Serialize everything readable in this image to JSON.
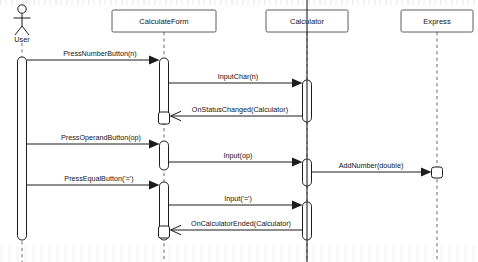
{
  "diagram": {
    "type": "uml-sequence-diagram",
    "width": 478,
    "height": 262,
    "background": "#ffffff",
    "line_color": "#1c1c1c",
    "lifeline_color": "#5a5a5a",
    "box_fill": "#ffffff"
  },
  "participants": [
    {
      "id": "user",
      "label": "User",
      "kind": "actor",
      "x": 22,
      "head_y": 38
    },
    {
      "id": "calculateform",
      "label": "CalculateForm",
      "kind": "object",
      "x": 164,
      "head_y": 21
    },
    {
      "id": "calculator",
      "label": "Calculator",
      "kind": "object",
      "x": 307,
      "head_y": 21
    },
    {
      "id": "express",
      "label": "Express",
      "kind": "object",
      "x": 437,
      "head_y": 21
    }
  ],
  "messages": [
    {
      "n": 1,
      "label": "PressNumberButton(n)",
      "from": "user",
      "to": "calculateform",
      "y": 60,
      "dir": "right",
      "style": "call"
    },
    {
      "n": 2,
      "label": "InputChar(n)",
      "from": "calculateform",
      "to": "calculator",
      "y": 83,
      "dir": "right",
      "style": "call"
    },
    {
      "n": 3,
      "label": "OnStatusChanged(Calculator)",
      "from": "calculator",
      "to": "calculateform",
      "y": 116,
      "dir": "left",
      "style": "return"
    },
    {
      "n": 4,
      "label": "PressOperandButton(op)",
      "from": "user",
      "to": "calculateform",
      "y": 144,
      "dir": "right",
      "style": "call"
    },
    {
      "n": 5,
      "label": "Input(op)",
      "from": "calculateform",
      "to": "calculator",
      "y": 162,
      "dir": "right",
      "style": "call"
    },
    {
      "n": 6,
      "label": "AddNumber(double)",
      "from": "calculator",
      "to": "express",
      "y": 172,
      "dir": "right",
      "style": "call"
    },
    {
      "n": 7,
      "label": "PressEqualButton('=')",
      "from": "user",
      "to": "calculateform",
      "y": 185,
      "dir": "right",
      "style": "call"
    },
    {
      "n": 8,
      "label": "Input('=')",
      "from": "calculateform",
      "to": "calculator",
      "y": 205,
      "dir": "right",
      "style": "call"
    },
    {
      "n": 9,
      "label": "OnCalculatorEnded(Calculator)",
      "from": "calculator",
      "to": "calculateform",
      "y": 230,
      "dir": "left",
      "style": "return"
    }
  ],
  "activations": [
    {
      "participant": "user",
      "top": 57,
      "bottom": 240
    },
    {
      "participant": "calculateform",
      "top": 58,
      "bottom": 124
    },
    {
      "participant": "calculateform",
      "top": 141,
      "bottom": 170
    },
    {
      "participant": "calculateform",
      "top": 182,
      "bottom": 240
    },
    {
      "participant": "calculator",
      "top": 80,
      "bottom": 122
    },
    {
      "participant": "calculator",
      "top": 159,
      "bottom": 186
    },
    {
      "participant": "calculator",
      "top": 202,
      "bottom": 240
    }
  ],
  "nested_markers": [
    {
      "participant": "calculateform",
      "top": 112,
      "bottom": 124
    },
    {
      "participant": "calculateform",
      "top": 226,
      "bottom": 238
    },
    {
      "participant": "express",
      "top": 167,
      "bottom": 178
    }
  ],
  "cursor": {
    "x": 307,
    "top": 0,
    "bottom": 262,
    "visible": true
  }
}
